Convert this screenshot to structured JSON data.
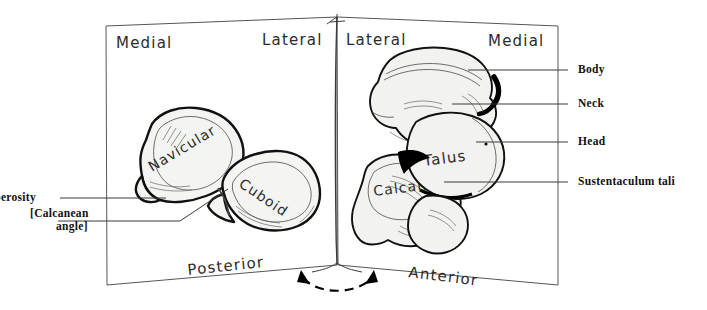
{
  "figure": {
    "background_color": "#ffffff",
    "ink_color": "#1a1a1a",
    "bone_fill_color": "#f2f2f0"
  },
  "left_panel": {
    "orientation_top_left": "Medial",
    "orientation_top_right": "Lateral",
    "orientation_bottom": "Posterior",
    "bones": [
      {
        "label": "Navicular",
        "rotation_deg": -31
      },
      {
        "label": "Cuboid",
        "rotation_deg": 34
      }
    ],
    "callouts": [
      {
        "label": "Tuberosity"
      },
      {
        "label": "[Calcanean",
        "label_line2": "angle]"
      }
    ]
  },
  "right_panel": {
    "orientation_top_left": "Lateral",
    "orientation_top_right": "Medial",
    "orientation_bottom": "Anterior",
    "bones": [
      {
        "label": "Talus",
        "rotation_deg": -7
      },
      {
        "label": "Calcan.",
        "rotation_deg": -7
      }
    ],
    "callouts": [
      {
        "label": "Body"
      },
      {
        "label": "Neck"
      },
      {
        "label": "Head"
      },
      {
        "label": "Sustentaculum tali"
      }
    ]
  },
  "fold_arrow": {
    "type": "double-headed-dashed-arc",
    "meaning": "panels fold together"
  }
}
